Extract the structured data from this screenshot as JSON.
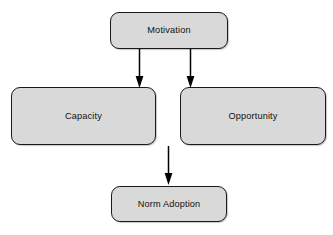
{
  "diagram": {
    "type": "flowchart",
    "background_color": "#ffffff",
    "node_fill_color": "#d9d9d9",
    "node_border_color": "#1a1a1a",
    "arrow_color": "#000000",
    "nodes": [
      {
        "id": "motivation",
        "label": "Motivation",
        "shape": "rounded-rectangle",
        "position": "top-center"
      },
      {
        "id": "capacity",
        "label": "Capacity",
        "shape": "rounded-rectangle",
        "position": "middle-left"
      },
      {
        "id": "opportunity",
        "label": "Opportunity",
        "shape": "rounded-rectangle",
        "position": "middle-right"
      },
      {
        "id": "norm_adoption",
        "label": "Norm Adoption",
        "shape": "rounded-rectangle",
        "position": "bottom-center"
      }
    ],
    "edges": [
      {
        "id": "motivation-to-capacity",
        "from": "motivation",
        "to": "capacity",
        "direction": "down",
        "style": "solid",
        "arrowhead": "filled-triangle"
      },
      {
        "id": "motivation-to-opportunity",
        "from": "motivation",
        "to": "opportunity",
        "direction": "down",
        "style": "solid",
        "arrowhead": "filled-triangle"
      },
      {
        "id": "to-norm-adoption",
        "from": "opportunity",
        "to": "norm_adoption",
        "direction": "down",
        "style": "solid",
        "arrowhead": "filled-triangle"
      }
    ]
  }
}
